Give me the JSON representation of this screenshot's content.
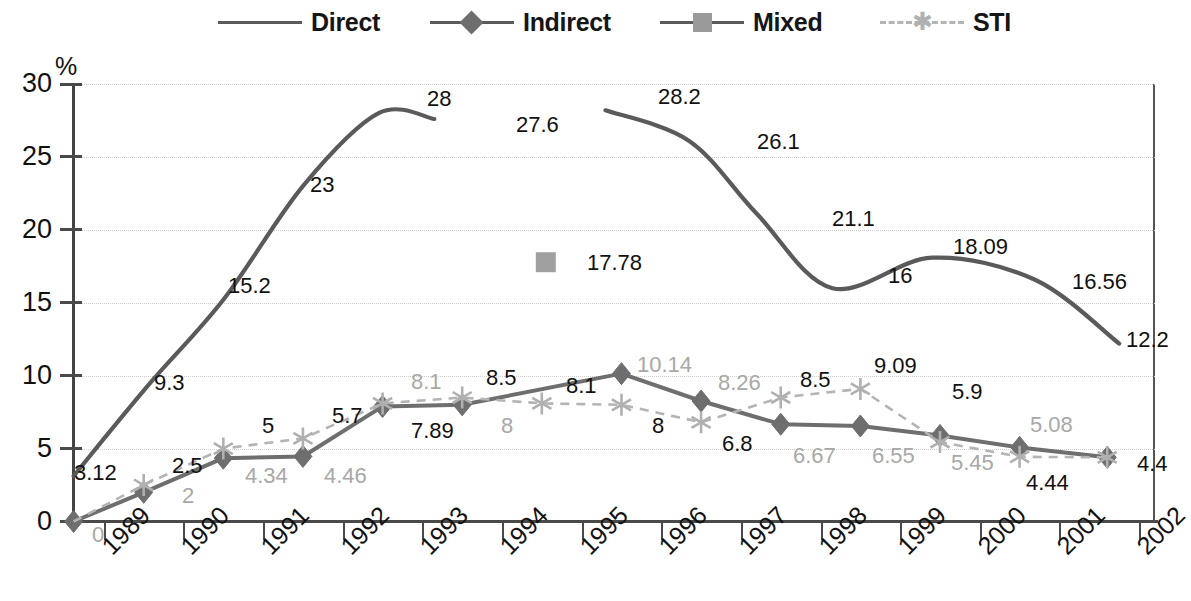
{
  "legend": {
    "items": [
      {
        "label": "Direct",
        "marker": "line",
        "color": "#5a5a5a"
      },
      {
        "label": "Indirect",
        "marker": "diamond-icon",
        "color": "#6e6e6e"
      },
      {
        "label": "Mixed",
        "marker": "square-icon",
        "color": "#9a9a9a"
      },
      {
        "label": "STI",
        "marker": "asterisk-icon",
        "color": "#b0b0b0"
      }
    ]
  },
  "axes": {
    "y_unit": "%",
    "y_ticks": [
      "0",
      "5",
      "10",
      "15",
      "20",
      "25",
      "30"
    ],
    "x_ticks": [
      "1989",
      "1990",
      "1991",
      "1992",
      "1993",
      "1994",
      "1995",
      "1996",
      "1997",
      "1998",
      "1999",
      "2000",
      "2001",
      "2002"
    ]
  },
  "chart_data": {
    "type": "line",
    "title": "",
    "xlabel": "",
    "ylabel": "%",
    "ylim": [
      0,
      30
    ],
    "xlim": [
      1988.6,
      2002.2
    ],
    "grid": true,
    "legend_position": "top",
    "x": [
      "1988.6",
      "1989.5",
      "1990.5",
      "1991.5",
      "1992.5",
      "1993.5",
      "1994.5",
      "1995.5",
      "1996.5",
      "1997.5",
      "1998.5",
      "1999.5",
      "2000.5",
      "2001.6"
    ],
    "series": [
      {
        "name": "Direct",
        "color": "#5a5a5a",
        "style": "solid",
        "points": [
          {
            "x": 1988.62,
            "y": 3.12,
            "label": "3.12"
          },
          {
            "x": 1989.55,
            "y": 9.3,
            "label": "9.3"
          },
          {
            "x": 1990.5,
            "y": 15.2,
            "label": "15.2"
          },
          {
            "x": 1991.5,
            "y": 23,
            "label": "23"
          },
          {
            "x": 1992.45,
            "y": 28,
            "label": "28"
          },
          {
            "x": 1993.15,
            "y": 27.6,
            "label": "27.6"
          },
          {
            "x": 1995.3,
            "y": 28.2,
            "label": "28.2"
          },
          {
            "x": 1996.35,
            "y": 26.1,
            "label": "26.1"
          },
          {
            "x": 1997.2,
            "y": 21.1,
            "label": "21.1"
          },
          {
            "x": 1998.15,
            "y": 16,
            "label": "16"
          },
          {
            "x": 1999.4,
            "y": 18.09,
            "label": "18.09"
          },
          {
            "x": 2000.7,
            "y": 16.56,
            "label": "16.56"
          },
          {
            "x": 2001.75,
            "y": 12.2,
            "label": "12.2"
          }
        ],
        "break_after_index": 5
      },
      {
        "name": "Indirect",
        "color": "#6e6e6e",
        "style": "solid",
        "marker": "diamond",
        "points": [
          {
            "x": 1988.62,
            "y": 0,
            "label": "0"
          },
          {
            "x": 1989.5,
            "y": 2,
            "label": "2"
          },
          {
            "x": 1990.5,
            "y": 4.34,
            "label": "4.34"
          },
          {
            "x": 1991.5,
            "y": 4.46,
            "label": "4.46"
          },
          {
            "x": 1992.5,
            "y": 7.89,
            "label": "7.89"
          },
          {
            "x": 1993.5,
            "y": 8,
            "label": "8"
          },
          {
            "x": 1995.5,
            "y": 10.14,
            "label": "10.14"
          },
          {
            "x": 1996.5,
            "y": 8.26,
            "label": "8.26"
          },
          {
            "x": 1997.5,
            "y": 6.67,
            "label": "6.67"
          },
          {
            "x": 1998.5,
            "y": 6.55,
            "label": "6.55"
          },
          {
            "x": 1999.5,
            "y": 5.9,
            "label": "5.9"
          },
          {
            "x": 2000.5,
            "y": 5.08,
            "label": "5.08"
          },
          {
            "x": 2001.6,
            "y": 4.4,
            "label": "4.4"
          }
        ]
      },
      {
        "name": "Mixed",
        "color": "#a0a0a0",
        "style": "marker-only",
        "marker": "square",
        "points": [
          {
            "x": 1994.55,
            "y": 17.78,
            "label": "17.78"
          }
        ]
      },
      {
        "name": "STI",
        "color": "#b4b4b4",
        "style": "dashed",
        "marker": "asterisk",
        "points": [
          {
            "x": 1988.62,
            "y": 0,
            "label": ""
          },
          {
            "x": 1989.5,
            "y": 2.5,
            "label": "2.5"
          },
          {
            "x": 1990.5,
            "y": 5,
            "label": "5"
          },
          {
            "x": 1991.5,
            "y": 5.7,
            "label": "5.7"
          },
          {
            "x": 1992.5,
            "y": 8.1,
            "label": "8.1"
          },
          {
            "x": 1993.5,
            "y": 8.5,
            "label": "8.5"
          },
          {
            "x": 1994.5,
            "y": 8.1,
            "label": "8.1"
          },
          {
            "x": 1995.5,
            "y": 8,
            "label": "8"
          },
          {
            "x": 1996.5,
            "y": 6.8,
            "label": "6.8"
          },
          {
            "x": 1997.5,
            "y": 8.5,
            "label": "8.5"
          },
          {
            "x": 1998.5,
            "y": 9.09,
            "label": "9.09"
          },
          {
            "x": 1999.5,
            "y": 5.45,
            "label": "5.45"
          },
          {
            "x": 2000.5,
            "y": 4.44,
            "label": "4.44"
          },
          {
            "x": 2001.6,
            "y": 4.4,
            "label": ""
          }
        ]
      }
    ],
    "data_labels": [
      {
        "text": "3.12",
        "x": 74,
        "y": 462,
        "tone": "dark"
      },
      {
        "text": "9.3",
        "x": 154,
        "y": 372,
        "tone": "dark"
      },
      {
        "text": "15.2",
        "x": 228,
        "y": 275,
        "tone": "dark"
      },
      {
        "text": "23",
        "x": 310,
        "y": 174,
        "tone": "dark"
      },
      {
        "text": "28",
        "x": 427,
        "y": 88,
        "tone": "dark"
      },
      {
        "text": "27.6",
        "x": 516,
        "y": 114,
        "tone": "dark"
      },
      {
        "text": "28.2",
        "x": 658,
        "y": 86,
        "tone": "dark"
      },
      {
        "text": "26.1",
        "x": 757,
        "y": 131,
        "tone": "dark"
      },
      {
        "text": "21.1",
        "x": 832,
        "y": 208,
        "tone": "dark"
      },
      {
        "text": "16",
        "x": 888,
        "y": 265,
        "tone": "dark"
      },
      {
        "text": "18.09",
        "x": 953,
        "y": 236,
        "tone": "dark"
      },
      {
        "text": "16.56",
        "x": 1072,
        "y": 271,
        "tone": "dark"
      },
      {
        "text": "12.2",
        "x": 1126,
        "y": 329,
        "tone": "dark"
      },
      {
        "text": "17.78",
        "x": 587,
        "y": 252,
        "tone": "dark"
      },
      {
        "text": "0",
        "x": 92,
        "y": 524,
        "tone": "gray"
      },
      {
        "text": "2",
        "x": 182,
        "y": 485,
        "tone": "gray"
      },
      {
        "text": "4.34",
        "x": 245,
        "y": 465,
        "tone": "gray"
      },
      {
        "text": "4.46",
        "x": 324,
        "y": 465,
        "tone": "gray"
      },
      {
        "text": "7.89",
        "x": 411,
        "y": 420,
        "tone": "dark"
      },
      {
        "text": "8",
        "x": 501,
        "y": 415,
        "tone": "gray"
      },
      {
        "text": "10.14",
        "x": 637,
        "y": 354,
        "tone": "gray"
      },
      {
        "text": "8.26",
        "x": 718,
        "y": 372,
        "tone": "gray"
      },
      {
        "text": "6.67",
        "x": 793,
        "y": 445,
        "tone": "gray"
      },
      {
        "text": "6.55",
        "x": 872,
        "y": 445,
        "tone": "gray"
      },
      {
        "text": "5.9",
        "x": 952,
        "y": 381,
        "tone": "dark"
      },
      {
        "text": "5.08",
        "x": 1030,
        "y": 414,
        "tone": "gray"
      },
      {
        "text": "4.4",
        "x": 1137,
        "y": 453,
        "tone": "dark"
      },
      {
        "text": "2.5",
        "x": 172,
        "y": 455,
        "tone": "dark"
      },
      {
        "text": "5",
        "x": 262,
        "y": 415,
        "tone": "dark"
      },
      {
        "text": "5.7",
        "x": 332,
        "y": 405,
        "tone": "dark"
      },
      {
        "text": "8.1",
        "x": 411,
        "y": 371,
        "tone": "gray"
      },
      {
        "text": "8.5",
        "x": 486,
        "y": 367,
        "tone": "dark"
      },
      {
        "text": "8.1",
        "x": 566,
        "y": 375,
        "tone": "dark"
      },
      {
        "text": "8",
        "x": 652,
        "y": 415,
        "tone": "dark"
      },
      {
        "text": "6.8",
        "x": 722,
        "y": 433,
        "tone": "dark"
      },
      {
        "text": "8.5",
        "x": 800,
        "y": 369,
        "tone": "dark"
      },
      {
        "text": "9.09",
        "x": 874,
        "y": 355,
        "tone": "dark"
      },
      {
        "text": "5.45",
        "x": 951,
        "y": 452,
        "tone": "gray"
      },
      {
        "text": "4.44",
        "x": 1026,
        "y": 472,
        "tone": "dark"
      }
    ]
  }
}
